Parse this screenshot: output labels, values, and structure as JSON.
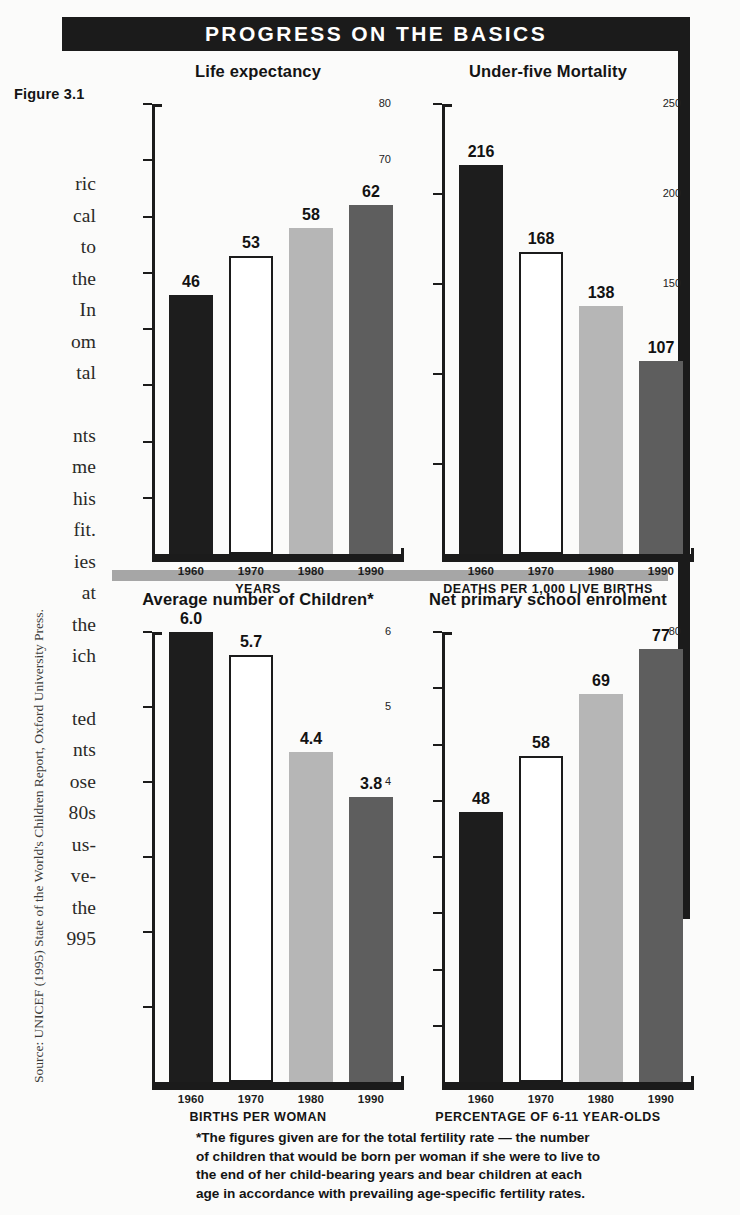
{
  "figure": {
    "label": "Figure 3.1",
    "banner_title": "PROGRESS ON THE BASICS",
    "source": "Source: UNICEF (1995) State of the World's Children Report, Oxford University Press.",
    "footnote_lines": [
      "*The figures given are for the total fertility rate — the number",
      "of children that would be born per woman if she were to live to",
      "the end of her child-bearing years and bear children at each",
      "age in accordance with prevailing age-specific fertility rates."
    ]
  },
  "colors": {
    "banner_bg": "#1b1b1b",
    "banner_text": "#ffffff",
    "rule": "#1b1b1b",
    "divider": "#a6a6a6",
    "series_1960": "#1d1d1d",
    "series_1970": "#ffffff",
    "series_1980": "#b6b6b6",
    "series_1990": "#5e5e5e"
  },
  "body_text": {
    "para1": [
      "ric",
      "cal",
      "to",
      "the",
      "In",
      "om",
      "tal"
    ],
    "para2": [
      "nts",
      "me",
      "his",
      "fit.",
      "ies",
      "at",
      "the",
      "ich"
    ],
    "para3": [
      "ted",
      "nts",
      "ose",
      "80s",
      "us-",
      "ve-",
      "the",
      "995"
    ]
  },
  "chart_data": [
    {
      "id": "life-expectancy",
      "type": "bar",
      "title": "Life expectancy",
      "categories": [
        "1960",
        "1970",
        "1980",
        "1990"
      ],
      "values": [
        46,
        53,
        58,
        62
      ],
      "value_labels": [
        "46",
        "53",
        "58",
        "62"
      ],
      "xlabel": "YEARS",
      "ylabel": "",
      "ylim": [
        0,
        80
      ],
      "yticks": [
        0,
        10,
        20,
        30,
        40,
        50,
        60,
        70,
        80
      ],
      "ytick_labels": [
        "0",
        "10",
        "20",
        "30",
        "40",
        "50",
        "60",
        "70",
        "80"
      ],
      "grid": false,
      "legend": "none"
    },
    {
      "id": "under-five-mortality",
      "type": "bar",
      "title": "Under-five Mortality",
      "categories": [
        "1960",
        "1970",
        "1980",
        "1990"
      ],
      "values": [
        216,
        168,
        138,
        107
      ],
      "value_labels": [
        "216",
        "168",
        "138",
        "107"
      ],
      "xlabel": "DEATHS PER 1,000 LIVE BIRTHS",
      "ylabel": "",
      "ylim": [
        0,
        250
      ],
      "yticks": [
        0,
        50,
        100,
        150,
        200,
        250
      ],
      "ytick_labels": [
        "0",
        "50",
        "100",
        "150",
        "200",
        "250"
      ],
      "grid": false,
      "legend": "none"
    },
    {
      "id": "average-number-of-children",
      "type": "bar",
      "title": "Average number of Children*",
      "categories": [
        "1960",
        "1970",
        "1980",
        "1990"
      ],
      "values": [
        6.0,
        5.7,
        4.4,
        3.8
      ],
      "value_labels": [
        "6.0",
        "5.7",
        "4.4",
        "3.8"
      ],
      "xlabel": "BIRTHS PER WOMAN",
      "ylabel": "",
      "ylim": [
        0,
        6
      ],
      "yticks": [
        0,
        1,
        2,
        3,
        4,
        5,
        6
      ],
      "ytick_labels": [
        "0",
        "1",
        "2",
        "3",
        "4",
        "5",
        "6"
      ],
      "grid": false,
      "legend": "none"
    },
    {
      "id": "net-primary-school-enrolment",
      "type": "bar",
      "title": "Net primary school enrolment",
      "categories": [
        "1960",
        "1970",
        "1980",
        "1990"
      ],
      "values": [
        48,
        58,
        69,
        77
      ],
      "value_labels": [
        "48",
        "58",
        "69",
        "77"
      ],
      "xlabel": "PERCENTAGE OF 6-11 YEAR-OLDS",
      "ylabel": "",
      "ylim": [
        0,
        80
      ],
      "yticks": [
        0,
        10,
        20,
        30,
        40,
        50,
        60,
        70,
        80
      ],
      "ytick_labels": [
        "0",
        "10",
        "20",
        "30",
        "40",
        "50",
        "60",
        "70",
        "80"
      ],
      "grid": false,
      "legend": "none"
    }
  ]
}
